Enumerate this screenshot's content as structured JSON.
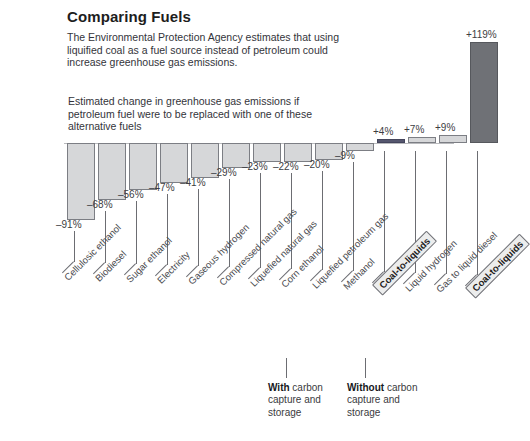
{
  "header": {
    "title": "Comparing Fuels",
    "lede": "The Environmental Protection Agency estimates that using liquified coal as a fuel source instead of petroleum could increase greenhouse gas emissions.",
    "subnote": "Estimated change in greenhouse gas emissions if petroleum fuel were to be replaced with one of these alternative fuels"
  },
  "annotations": [
    {
      "strong": "With",
      "rest": " carbon capture and storage"
    },
    {
      "strong": "Without",
      "rest": " carbon capture and storage"
    }
  ],
  "colors": {
    "bar_light": "#d6d7d9",
    "bar_dark": "#6f7176",
    "bar_navy": "#55566e",
    "bar_stroke": "#7c7e84",
    "baseline": "#b9babd",
    "text": "#3a3a3a",
    "title": "#1d1d1d"
  },
  "chart_data": {
    "type": "bar",
    "title": "Comparing Fuels",
    "subtitle": "Estimated change in greenhouse gas emissions if petroleum fuel were to be replaced with one of these alternative fuels",
    "xlabel": "",
    "ylabel": "Change in greenhouse gas emissions (%)",
    "ylim": [
      -91,
      119
    ],
    "grid": false,
    "legend": false,
    "units": "percent",
    "baseline": 0,
    "categories": [
      "Cellulosic ethanol",
      "Biodiesel",
      "Sugar ethanol",
      "Electricity",
      "Gaseous hydrogen",
      "Compressed natural gas",
      "Liquefied natural gas",
      "Corn ethanol",
      "Liquefied petroleum gas",
      "Methanol",
      "Coal-to-liquids",
      "Liquid hydrogen",
      "Gas to liquid diesel",
      "Coal-to-liquids"
    ],
    "values": [
      -91,
      -68,
      -56,
      -47,
      -41,
      -29,
      -23,
      -22,
      -20,
      -9,
      4,
      7,
      9,
      119
    ],
    "value_labels": [
      "–91%",
      "–68%",
      "–56%",
      "–47%",
      "–41%",
      "–29%",
      "–23%",
      "–22%",
      "–20%",
      "–9%",
      "+4%",
      "+7%",
      "+9%",
      "+119%"
    ],
    "highlighted_categories": [
      "Coal-to-liquids"
    ],
    "bar_styles": [
      "light",
      "light",
      "light",
      "light",
      "light",
      "light",
      "light",
      "light",
      "light",
      "light",
      "navy",
      "light",
      "light",
      "dark"
    ],
    "annotations": [
      {
        "text": "With carbon capture and storage",
        "points_to": "Coal-to-liquids (+4%)"
      },
      {
        "text": "Without carbon capture and storage",
        "points_to": "Coal-to-liquids (+119%)"
      }
    ]
  }
}
